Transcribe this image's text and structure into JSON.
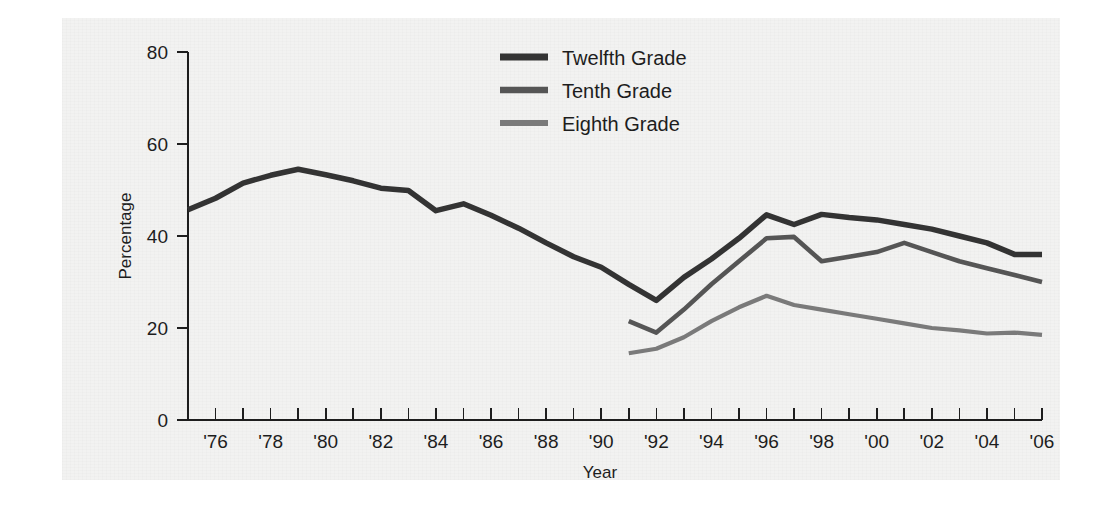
{
  "chart_data": {
    "type": "line",
    "title": "",
    "subtitle": "",
    "xlabel": "Year",
    "ylabel": "Percentage",
    "grid": false,
    "legend_position": "top-center",
    "xlim": [
      1975,
      2006
    ],
    "ylim": [
      0,
      80
    ],
    "yticks": [
      0,
      20,
      40,
      60,
      80
    ],
    "ytick_labels": [
      "0",
      "20",
      "40",
      "60",
      "80"
    ],
    "xticks": [
      1975,
      1976,
      1977,
      1978,
      1979,
      1980,
      1981,
      1982,
      1983,
      1984,
      1985,
      1986,
      1987,
      1988,
      1989,
      1990,
      1991,
      1992,
      1993,
      1994,
      1995,
      1996,
      1997,
      1998,
      1999,
      2000,
      2001,
      2002,
      2003,
      2004,
      2005,
      2006
    ],
    "xtick_labels": [
      "",
      "'76",
      "",
      "'78",
      "",
      "'80",
      "",
      "'82",
      "",
      "'84",
      "",
      "'86",
      "",
      "'88",
      "",
      "'90",
      "",
      "'92",
      "",
      "'94",
      "",
      "'96",
      "",
      "'98",
      "",
      "'00",
      "",
      "'02",
      "",
      "'04",
      "",
      "'06"
    ],
    "series": [
      {
        "name": "Twelfth Grade",
        "color": "#333333",
        "x": [
          1975,
          1976,
          1977,
          1978,
          1979,
          1980,
          1981,
          1982,
          1983,
          1984,
          1985,
          1986,
          1987,
          1988,
          1989,
          1990,
          1991,
          1992,
          1993,
          1994,
          1995,
          1996,
          1997,
          1998,
          1999,
          2000,
          2001,
          2002,
          2003,
          2004,
          2005,
          2006
        ],
        "values": [
          45.7,
          48.2,
          51.5,
          53.2,
          54.5,
          53.3,
          52.0,
          50.4,
          49.9,
          45.5,
          47.0,
          44.5,
          41.7,
          38.5,
          35.5,
          33.2,
          29.5,
          26.0,
          31.0,
          35.0,
          39.5,
          44.6,
          42.5,
          44.7,
          44.0,
          43.5,
          42.5,
          41.5,
          40.0,
          38.5,
          36.0,
          36.0
        ]
      },
      {
        "name": "Tenth Grade",
        "color": "#555555",
        "x": [
          1991,
          1992,
          1993,
          1994,
          1995,
          1996,
          1997,
          1998,
          1999,
          2000,
          2001,
          2002,
          2003,
          2004,
          2005,
          2006
        ],
        "values": [
          21.5,
          19.0,
          24.0,
          29.5,
          34.5,
          39.5,
          39.8,
          34.5,
          35.5,
          36.5,
          38.5,
          36.5,
          34.5,
          33.0,
          31.5,
          30.0
        ]
      },
      {
        "name": "Eighth Grade",
        "color": "#7a7a7a",
        "x": [
          1991,
          1992,
          1993,
          1994,
          1995,
          1996,
          1997,
          1998,
          1999,
          2000,
          2001,
          2002,
          2003,
          2004,
          2005,
          2006
        ],
        "values": [
          14.5,
          15.5,
          18.0,
          21.5,
          24.5,
          27.0,
          25.0,
          24.0,
          23.0,
          22.0,
          21.0,
          20.0,
          19.5,
          18.8,
          19.0,
          18.5
        ]
      }
    ]
  },
  "legend": {
    "items": [
      {
        "label": "Twelfth Grade",
        "color": "#333333"
      },
      {
        "label": "Tenth Grade",
        "color": "#555555"
      },
      {
        "label": "Eighth Grade",
        "color": "#7a7a7a"
      }
    ]
  },
  "axes": {
    "y_title": "Percentage",
    "x_title": "Year"
  }
}
